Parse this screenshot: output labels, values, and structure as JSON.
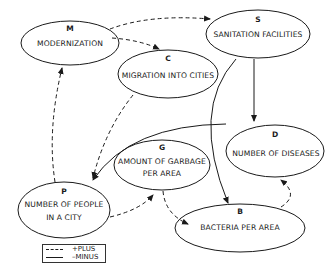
{
  "diagram": {
    "type": "causal-loop",
    "nodes": [
      {
        "id": "M",
        "letter": "M",
        "label": "MODERNIZATION"
      },
      {
        "id": "C",
        "letter": "C",
        "label": "MIGRATION INTO CITIES"
      },
      {
        "id": "S",
        "letter": "S",
        "label": "SANITATION FACILITIES"
      },
      {
        "id": "D",
        "letter": "D",
        "label": "NUMBER OF DISEASES"
      },
      {
        "id": "G",
        "letter": "G",
        "label_line1": "AMOUNT OF GARBAGE",
        "label_line2": "PER AREA"
      },
      {
        "id": "P",
        "letter": "P",
        "label_line1": "NUMBER OF PEOPLE",
        "label_line2": "IN A CITY"
      },
      {
        "id": "B",
        "letter": "B",
        "label": "BACTERIA PER AREA"
      }
    ],
    "edges": [
      {
        "from": "M",
        "to": "S",
        "polarity": "plus"
      },
      {
        "from": "M",
        "to": "C",
        "polarity": "plus"
      },
      {
        "from": "C",
        "to": "P",
        "polarity": "plus"
      },
      {
        "from": "P",
        "to": "M",
        "polarity": "plus"
      },
      {
        "from": "P",
        "to": "G",
        "polarity": "plus"
      },
      {
        "from": "G",
        "to": "B",
        "polarity": "plus"
      },
      {
        "from": "B",
        "to": "D",
        "polarity": "plus"
      },
      {
        "from": "S",
        "to": "D",
        "polarity": "minus"
      },
      {
        "from": "S",
        "to": "B",
        "polarity": "minus"
      },
      {
        "from": "D",
        "to": "P",
        "polarity": "minus"
      }
    ]
  },
  "legend": {
    "plus_label": "+PLUS",
    "minus_label": "–MINUS"
  }
}
